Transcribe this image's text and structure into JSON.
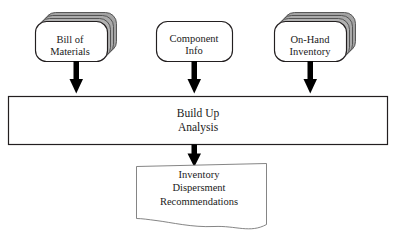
{
  "diagram": {
    "background_color": "#ffffff",
    "line_color": "#231f20",
    "stack_fill_color": "#a9a9a9",
    "stack_edge_color": "#4d4d4d",
    "node_fill_color": "#ffffff",
    "arrow_color": "#000000",
    "inputs": [
      {
        "id": "bill-of-materials",
        "shape": "stacked-rounded-rectangle",
        "stack_count": 4,
        "lines": [
          "Bill of",
          "Materials"
        ]
      },
      {
        "id": "component-info",
        "shape": "rounded-rectangle",
        "stack_count": 1,
        "lines": [
          "Component",
          "Info"
        ]
      },
      {
        "id": "on-hand-inventory",
        "shape": "stacked-rounded-rectangle",
        "stack_count": 4,
        "lines": [
          "On-Hand",
          "Inventory"
        ]
      }
    ],
    "process": {
      "id": "build-up-analysis",
      "shape": "rectangle",
      "lines": [
        "Build Up",
        "Analysis"
      ]
    },
    "output": {
      "id": "inventory-dispersment-recommendations",
      "shape": "document",
      "lines": [
        "Inventory",
        "Dispersment",
        "Recommendations"
      ]
    },
    "connectors": [
      {
        "id": "arrow-bom-to-analysis",
        "from": "bill-of-materials",
        "to": "build-up-analysis",
        "direction": "down"
      },
      {
        "id": "arrow-component-to-analysis",
        "from": "component-info",
        "to": "build-up-analysis",
        "direction": "down"
      },
      {
        "id": "arrow-onhand-to-analysis",
        "from": "on-hand-inventory",
        "to": "build-up-analysis",
        "direction": "down"
      },
      {
        "id": "arrow-analysis-to-output",
        "from": "build-up-analysis",
        "to": "inventory-dispersment-recommendations",
        "direction": "down"
      }
    ]
  }
}
